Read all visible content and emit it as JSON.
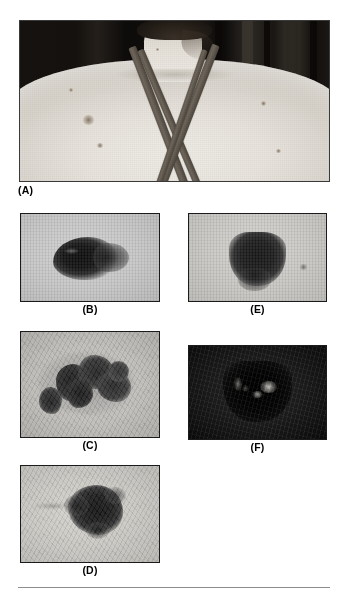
{
  "figure": {
    "background_color": "#ffffff",
    "panel_border_color": "#1b1b1b",
    "footer_rule_color": "#8d8d8d",
    "panels": [
      {
        "key": "A",
        "label": "(A)",
        "label_align": "left",
        "description": "Clinical photograph of the upper back and neck of a patient, showing pale skin, crossed dark swimsuit straps and several scattered pigmented naevi",
        "image_type": "clinical-photograph",
        "dominant_colors": [
          "#e9e5de",
          "#5e564c",
          "#15120f"
        ]
      },
      {
        "key": "B",
        "label": "(B)",
        "label_align": "center",
        "description": "Close-up of a dark brown-black pigmented lesion with an oval, slightly irregular border on light skin",
        "image_type": "dermoscopy-closeup",
        "dominant_colors": [
          "#c4c4c4",
          "#121212"
        ]
      },
      {
        "key": "C",
        "label": "(C)",
        "label_align": "center",
        "description": "Close-up of a large, markedly irregular multi-lobed pigmented lesion with scattered dark clumps and notched borders",
        "image_type": "dermoscopy-closeup",
        "dominant_colors": [
          "#bab8b4",
          "#1c1c1c"
        ]
      },
      {
        "key": "D",
        "label": "(D)",
        "label_align": "center",
        "description": "Close-up of an asymmetric dark pigmented lesion sited right of centre with irregular projecting lobes",
        "image_type": "dermoscopy-closeup",
        "dominant_colors": [
          "#c6c4bf",
          "#171717"
        ]
      },
      {
        "key": "E",
        "label": "(E)",
        "label_align": "center",
        "description": "Close-up of a raised, rounded dark pigmented lesion with a fairly even dark brown-black colour on light skin",
        "image_type": "dermoscopy-closeup",
        "dominant_colors": [
          "#c7c5c1",
          "#1b1b1b"
        ]
      },
      {
        "key": "F",
        "label": "(F)",
        "label_align": "center",
        "description": "Close-up of a deeply pigmented lesion on darkly exposed skin, with small bright specks of reflected light within the lesion",
        "image_type": "dermoscopy-closeup",
        "dominant_colors": [
          "#141414",
          "#000000",
          "#e4e2dc"
        ]
      }
    ]
  }
}
